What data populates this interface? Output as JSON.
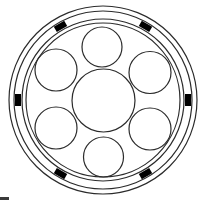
{
  "diagram": {
    "title": "",
    "center": [
      103,
      100
    ],
    "colors": {
      "stroke": "#2b2b2b",
      "marker_fill": "#000000",
      "background": "#ffffff"
    },
    "outer_rings": [
      {
        "r": 94
      },
      {
        "r": 89
      },
      {
        "r": 81
      },
      {
        "r": 77
      }
    ],
    "markers": {
      "count": 6,
      "radius": 85,
      "angles_deg": [
        0,
        60,
        120,
        180,
        240,
        300
      ],
      "width": 6,
      "length": 12
    },
    "central_circle": {
      "cx": 103.5,
      "cy": 100.5,
      "r": 31.5
    },
    "satellite_circles": [
      {
        "label": "top",
        "cx": 102,
        "cy": 47,
        "r": 20
      },
      {
        "label": "upper-right",
        "cx": 150,
        "cy": 72.5,
        "r": 21
      },
      {
        "label": "lower-right",
        "cx": 150,
        "cy": 129,
        "r": 21
      },
      {
        "label": "bottom",
        "cx": 103.5,
        "cy": 157,
        "r": 20
      },
      {
        "label": "lower-left",
        "cx": 56,
        "cy": 128,
        "r": 21
      },
      {
        "label": "upper-left",
        "cx": 56,
        "cy": 70,
        "r": 21
      }
    ]
  }
}
